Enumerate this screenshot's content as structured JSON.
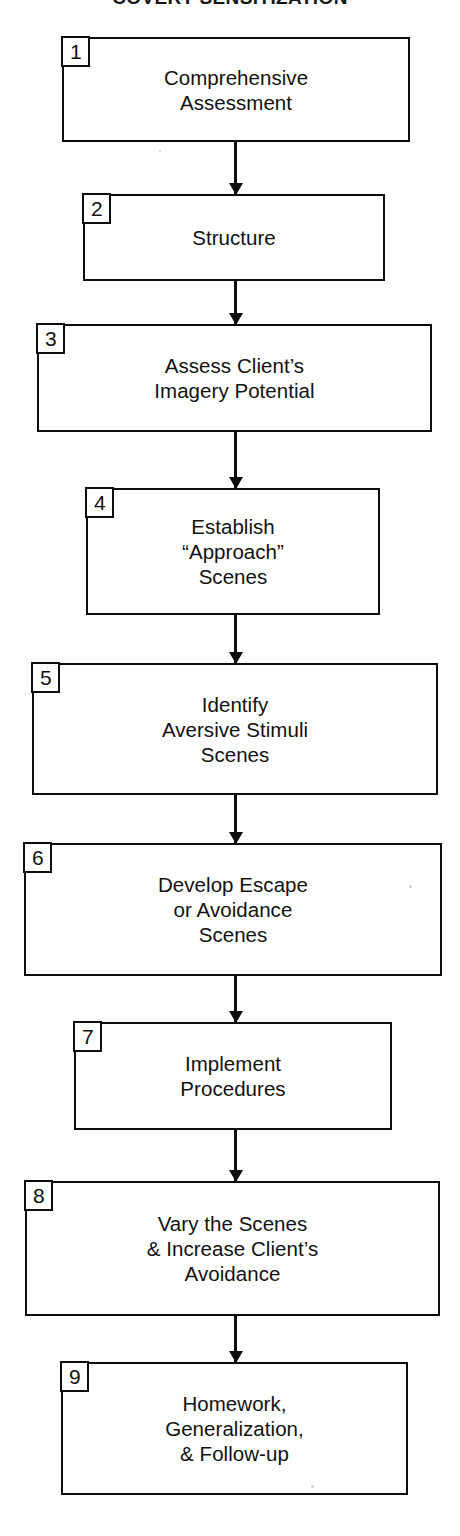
{
  "title": "COVERT SENSITIZATION",
  "chart_data": {
    "type": "diagram",
    "diagram_type": "flowchart",
    "orientation": "vertical",
    "title": "COVERT SENSITIZATION",
    "node_count": 9,
    "connector_count": 8,
    "nodes": [
      {
        "number": "1",
        "label": "Comprehensive\nAssessment",
        "x": 62,
        "y": 37,
        "width": 348,
        "height": 105
      },
      {
        "number": "2",
        "label": "Structure",
        "x": 83,
        "y": 194,
        "width": 302,
        "height": 87
      },
      {
        "number": "3",
        "label": "Assess Client’s\nImagery Potential",
        "x": 37,
        "y": 324,
        "width": 395,
        "height": 108
      },
      {
        "number": "4",
        "label": "Establish\n“Approach”\nScenes",
        "x": 86,
        "y": 488,
        "width": 294,
        "height": 127
      },
      {
        "number": "5",
        "label": "Identify\nAversive Stimuli\nScenes",
        "x": 32,
        "y": 663,
        "width": 406,
        "height": 132
      },
      {
        "number": "6",
        "label": "Develop Escape\nor Avoidance\nScenes",
        "x": 24,
        "y": 843,
        "width": 418,
        "height": 133
      },
      {
        "number": "7",
        "label": "Implement\nProcedures",
        "x": 74,
        "y": 1022,
        "width": 318,
        "height": 108
      },
      {
        "number": "8",
        "label": "Vary the Scenes\n& Increase Client’s\nAvoidance",
        "x": 25,
        "y": 1181,
        "width": 415,
        "height": 135
      },
      {
        "number": "9",
        "label": "Homework,\nGeneralization,\n& Follow-up",
        "x": 61,
        "y": 1362,
        "width": 347,
        "height": 133
      }
    ],
    "edges": [
      {
        "from": "1",
        "to": "2",
        "y": 142,
        "height": 52
      },
      {
        "from": "2",
        "to": "3",
        "y": 281,
        "height": 43
      },
      {
        "from": "3",
        "to": "4",
        "y": 432,
        "height": 56
      },
      {
        "from": "4",
        "to": "5",
        "y": 615,
        "height": 48
      },
      {
        "from": "5",
        "to": "6",
        "y": 795,
        "height": 48
      },
      {
        "from": "6",
        "to": "7",
        "y": 976,
        "height": 46
      },
      {
        "from": "7",
        "to": "8",
        "y": 1130,
        "height": 51
      },
      {
        "from": "8",
        "to": "9",
        "y": 1316,
        "height": 46
      }
    ],
    "colors": {
      "stroke": "#0d0d0d",
      "fill": "#ffffff",
      "text": "#121212",
      "background": "#fdfdfd"
    }
  }
}
